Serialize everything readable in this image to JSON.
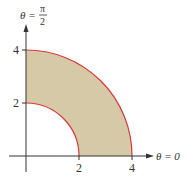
{
  "figure": {
    "region": {
      "r_inner": 2,
      "r_outer": 4,
      "theta_min": "0",
      "theta_max": "π/2"
    },
    "colors": {
      "fill": "#d6c9a8",
      "curve": "#d8383a",
      "axis": "#333333"
    },
    "axes": {
      "vertical_label_lhs": "θ =",
      "vertical_label_num": "π",
      "vertical_label_den": "2",
      "horizontal_label": "θ = 0"
    },
    "ticks": {
      "y": [
        "4",
        "2"
      ],
      "x": [
        "2",
        "4"
      ]
    }
  }
}
